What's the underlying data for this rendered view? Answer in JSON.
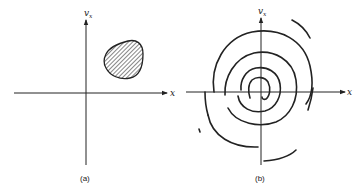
{
  "figure": {
    "panels": [
      {
        "id": "a",
        "caption": "(a)",
        "x_axis_label": "x",
        "y_axis_label": "v",
        "y_axis_subscript": "x",
        "content": "shaded compact region in first quadrant"
      },
      {
        "id": "b",
        "caption": "(b)",
        "x_axis_label": "x",
        "y_axis_label": "v",
        "y_axis_subscript": "x",
        "content": "region stretched into a thin spiral filament"
      }
    ],
    "colors": {
      "ink": "#222222",
      "background": "#ffffff"
    }
  }
}
